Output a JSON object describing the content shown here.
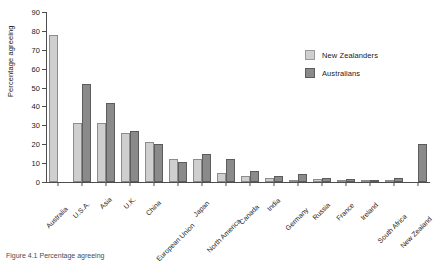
{
  "chart_data": {
    "type": "bar",
    "title": "",
    "xlabel": "",
    "ylabel": "Percentage agreeing",
    "ylim": [
      0,
      90
    ],
    "yticks": [
      0,
      10,
      20,
      30,
      40,
      50,
      60,
      70,
      80,
      90
    ],
    "grid": false,
    "legend_position": "upper-right-inside",
    "categories": [
      "Australia",
      "U.S.A.",
      "Asia",
      "U.K.",
      "China",
      "European Union",
      "Japan",
      "North America",
      "Canada",
      "India",
      "Germany",
      "Russia",
      "France",
      "Ireland",
      "South Africa",
      "New Zealand"
    ],
    "series": [
      {
        "name": "New Zealanders",
        "color": "#cfcfcf",
        "values": [
          78,
          31,
          31,
          26,
          21,
          12,
          12,
          5,
          3,
          2,
          1,
          1.5,
          1,
          0.5,
          0.8,
          0
        ]
      },
      {
        "name": "Australians",
        "color": "#8a8a8a",
        "values": [
          0,
          52,
          42,
          27,
          20,
          10.5,
          15,
          12,
          6,
          3,
          4,
          2,
          1.5,
          0.5,
          2,
          20
        ]
      }
    ]
  },
  "axes": {
    "y_title": "Percentage agreeing",
    "y_tick_labels": [
      "0",
      "10",
      "20",
      "30",
      "40",
      "50",
      "60",
      "70",
      "80",
      "90"
    ]
  },
  "legend": {
    "items": [
      {
        "label": "New Zealanders",
        "swatch": "nz"
      },
      {
        "label": "Australians",
        "swatch": "au"
      }
    ]
  },
  "caption": {
    "text": "Figure 4.1 Percentage agreeing"
  }
}
